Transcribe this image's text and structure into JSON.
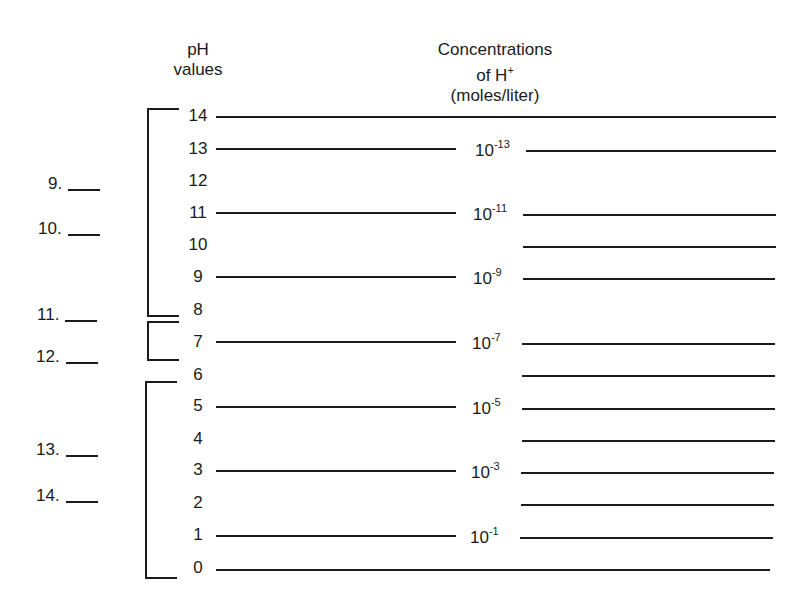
{
  "headers": {
    "ph_line1": "pH",
    "ph_line2": "values",
    "conc_line1": "Concentrations",
    "conc_line2_base": "of H",
    "conc_line2_sup": "+",
    "conc_line3": "(moles/liter)"
  },
  "ph_values": [
    "14",
    "13",
    "12",
    "11",
    "10",
    "9",
    "8",
    "7",
    "6",
    "5",
    "4",
    "3",
    "2",
    "1",
    "0"
  ],
  "concentrations": [
    {
      "ph": "13",
      "base": "10",
      "exp": "-13"
    },
    {
      "ph": "11",
      "base": "10",
      "exp": "-11"
    },
    {
      "ph": "9",
      "base": "10",
      "exp": "-9"
    },
    {
      "ph": "7",
      "base": "10",
      "exp": "-7"
    },
    {
      "ph": "5",
      "base": "10",
      "exp": "-5"
    },
    {
      "ph": "3",
      "base": "10",
      "exp": "-3"
    },
    {
      "ph": "1",
      "base": "10",
      "exp": "-1"
    }
  ],
  "answers": [
    {
      "num": "9."
    },
    {
      "num": "10."
    },
    {
      "num": "11."
    },
    {
      "num": "12."
    },
    {
      "num": "13."
    },
    {
      "num": "14."
    }
  ],
  "brackets": [
    {
      "range": "14-8",
      "meaning": "basic"
    },
    {
      "range": "7",
      "meaning": "neutral"
    },
    {
      "range": "6-0",
      "meaning": "acidic"
    }
  ],
  "colors": {
    "ink": "#1a1a1a",
    "background": "#ffffff"
  }
}
